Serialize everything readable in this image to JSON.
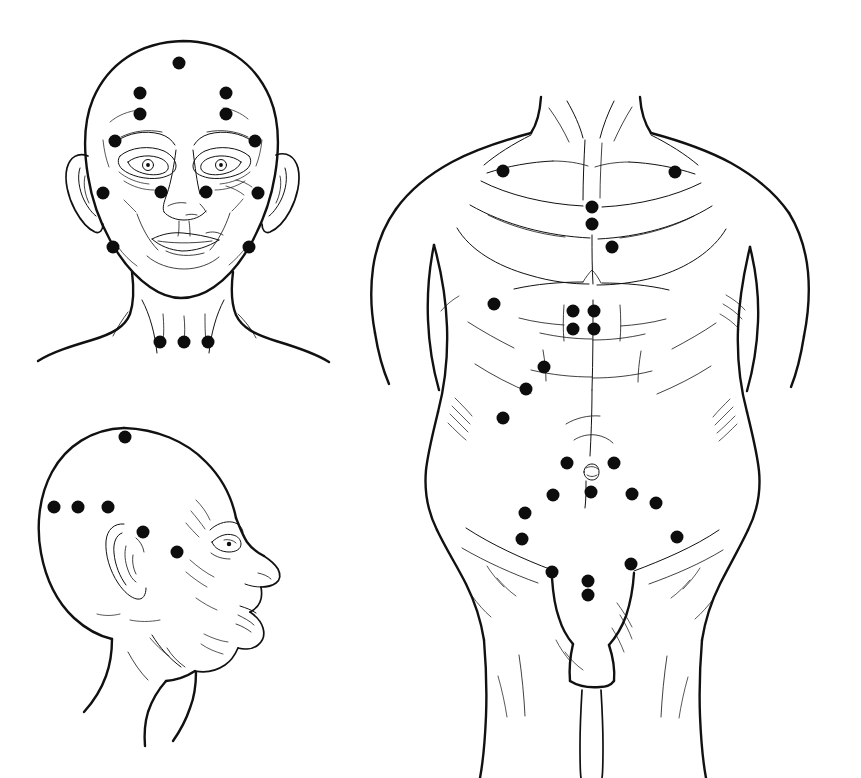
{
  "figure": {
    "title": "Acupuncture point chart — head and anterior trunk",
    "background_color": "#ffffff",
    "ink_color": "#111111",
    "point_color": "#0d0d0d",
    "point_radius": 6.5,
    "width": 861,
    "height": 778
  },
  "panels": [
    {
      "id": "face-frontal",
      "name": "Frontal view of head, face and neck",
      "point_count": 17,
      "points": [
        {
          "id": "f1",
          "name": "vertex-midline",
          "x": 179,
          "y": 63
        },
        {
          "id": "f2",
          "name": "forehead-upper-left",
          "x": 140,
          "y": 93
        },
        {
          "id": "f3",
          "name": "forehead-upper-right",
          "x": 226,
          "y": 93
        },
        {
          "id": "f4",
          "name": "forehead-lower-left",
          "x": 140,
          "y": 114
        },
        {
          "id": "f5",
          "name": "forehead-lower-right",
          "x": 226,
          "y": 114
        },
        {
          "id": "f6",
          "name": "brow-lateral-left",
          "x": 115,
          "y": 141
        },
        {
          "id": "f7",
          "name": "brow-lateral-right",
          "x": 255,
          "y": 141
        },
        {
          "id": "f8",
          "name": "preauricular-left",
          "x": 103,
          "y": 193
        },
        {
          "id": "f9",
          "name": "nasolabial-left",
          "x": 161,
          "y": 192
        },
        {
          "id": "f10",
          "name": "nasolabial-right",
          "x": 206,
          "y": 192
        },
        {
          "id": "f11",
          "name": "preauricular-right",
          "x": 258,
          "y": 193
        },
        {
          "id": "f12",
          "name": "jaw-angle-left",
          "x": 113,
          "y": 247
        },
        {
          "id": "f13",
          "name": "jaw-angle-right",
          "x": 249,
          "y": 247
        },
        {
          "id": "f14",
          "name": "supraclavicular-left",
          "x": 160,
          "y": 342
        },
        {
          "id": "f15",
          "name": "supraclavicular-mid",
          "x": 184,
          "y": 342
        },
        {
          "id": "f16",
          "name": "supraclavicular-right",
          "x": 208,
          "y": 342
        }
      ]
    },
    {
      "id": "face-profile",
      "name": "Lateral (profile) view of head",
      "point_count": 6,
      "points": [
        {
          "id": "p1",
          "name": "vertex-lateral",
          "x": 125,
          "y": 437
        },
        {
          "id": "p2",
          "name": "occipital-posterior",
          "x": 54,
          "y": 507
        },
        {
          "id": "p3",
          "name": "occipital-middle",
          "x": 78,
          "y": 507
        },
        {
          "id": "p4",
          "name": "occipital-anterior",
          "x": 108,
          "y": 507
        },
        {
          "id": "p5",
          "name": "auricular-apex",
          "x": 143,
          "y": 532
        },
        {
          "id": "p6",
          "name": "cheek-lateral",
          "x": 177,
          "y": 552
        }
      ]
    },
    {
      "id": "trunk-anterior",
      "name": "Anterior view of trunk — chest, abdomen, groin",
      "point_count": 25,
      "points": [
        {
          "id": "t1",
          "name": "infraclavicular-left",
          "x": 503,
          "y": 171
        },
        {
          "id": "t2",
          "name": "infraclavicular-right",
          "x": 675,
          "y": 172
        },
        {
          "id": "t3",
          "name": "sternum-upper",
          "x": 592,
          "y": 207
        },
        {
          "id": "t4",
          "name": "sternum-middle",
          "x": 592,
          "y": 224
        },
        {
          "id": "t5",
          "name": "sternum-lower",
          "x": 612,
          "y": 247
        },
        {
          "id": "t6",
          "name": "epigastric-lateral-left",
          "x": 494,
          "y": 304
        },
        {
          "id": "t7",
          "name": "epigastric-paramedian-left-upper",
          "x": 573,
          "y": 311
        },
        {
          "id": "t8",
          "name": "epigastric-paramedian-right-upper",
          "x": 594,
          "y": 311
        },
        {
          "id": "t9",
          "name": "epigastric-paramedian-left-lower",
          "x": 573,
          "y": 329
        },
        {
          "id": "t10",
          "name": "epigastric-paramedian-right-lower",
          "x": 594,
          "y": 329
        },
        {
          "id": "t11",
          "name": "umbilical-lateral-left-upper",
          "x": 544,
          "y": 367
        },
        {
          "id": "t12",
          "name": "umbilical-lateral-left-middle",
          "x": 526,
          "y": 389
        },
        {
          "id": "t13",
          "name": "flank-left",
          "x": 503,
          "y": 418
        },
        {
          "id": "t14",
          "name": "periumbilical-left",
          "x": 567,
          "y": 463
        },
        {
          "id": "t15",
          "name": "periumbilical-right",
          "x": 614,
          "y": 463
        },
        {
          "id": "t16",
          "name": "hypogastric-left",
          "x": 553,
          "y": 495
        },
        {
          "id": "t17",
          "name": "hypogastric-midline",
          "x": 591,
          "y": 492
        },
        {
          "id": "t18",
          "name": "hypogastric-right",
          "x": 632,
          "y": 494
        },
        {
          "id": "t19",
          "name": "hypogastric-lateral-right",
          "x": 656,
          "y": 503
        },
        {
          "id": "t20",
          "name": "iliac-left",
          "x": 525,
          "y": 513
        },
        {
          "id": "t21",
          "name": "inguinal-left-upper",
          "x": 522,
          "y": 539
        },
        {
          "id": "t22",
          "name": "inguinal-right-upper",
          "x": 677,
          "y": 537
        },
        {
          "id": "t23",
          "name": "inguinal-right-lower",
          "x": 631,
          "y": 564
        },
        {
          "id": "t24",
          "name": "inguinal-left-lower",
          "x": 552,
          "y": 572
        },
        {
          "id": "t25",
          "name": "pubic-upper",
          "x": 588,
          "y": 581
        },
        {
          "id": "t26",
          "name": "pubic-lower",
          "x": 588,
          "y": 595
        }
      ]
    }
  ]
}
